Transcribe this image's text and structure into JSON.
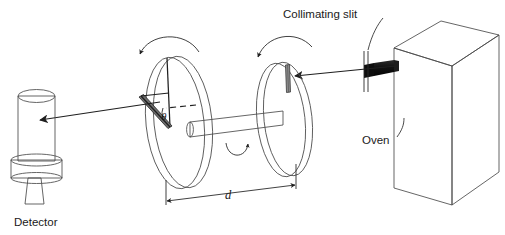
{
  "figure": {
    "background_color": "#ffffff"
  },
  "labels": {
    "collimating_slit": "Collimating slit",
    "oven": "Oven",
    "detector": "Detector",
    "distance": "d",
    "angle": "θ"
  },
  "colors": {
    "ink": "#1a1a1a",
    "outline": "#4a4a4a",
    "oven_front": "#fdfdfd",
    "oven_side": "#a8a8a8",
    "oven_top": "#d8d8d8",
    "nozzle": "#141414",
    "disk_light": "#f4f4f4",
    "disk_mid": "#cfcfcf",
    "disk_dark": "#a5a5a5",
    "shaft_light": "#f2f2f2",
    "shaft_dark": "#9c9c9c",
    "detector_light": "#f0f0f0",
    "detector_dark": "#9a9a9a",
    "slit_dark": "#2a2a2a"
  },
  "components": {
    "oven": {
      "name": "oven",
      "description": "cubic source box at right with black collimating nozzle"
    },
    "collimating_slit": {
      "name": "collimating-slit",
      "description": "thin vertical slit in front of the oven nozzle"
    },
    "disk_near": {
      "name": "rotating-disk-near",
      "description": "left rotating disk with slit offset by angle theta"
    },
    "disk_far": {
      "name": "rotating-disk-far",
      "description": "right rotating disk with radial slit at top"
    },
    "shaft": {
      "name": "rotating-shaft",
      "description": "axle connecting the two disks, separation d"
    },
    "detector": {
      "name": "detector",
      "description": "cylindrical detector at far left"
    },
    "beam": {
      "name": "molecular-beam",
      "description": "beam path from oven through both disks to detector"
    }
  }
}
